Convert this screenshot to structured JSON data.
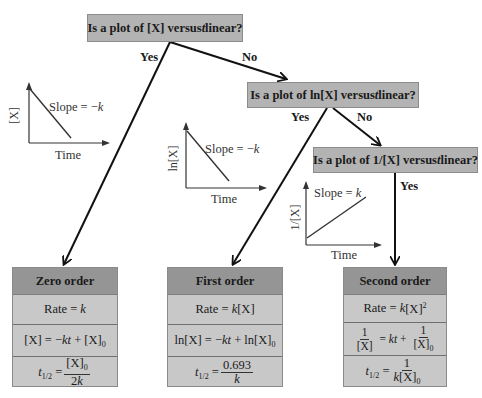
{
  "questions": [
    {
      "id": "q1",
      "pre": "Is a plot of [X] versus ",
      "var": "t",
      "post": " linear?"
    },
    {
      "id": "q2",
      "pre": "Is a plot of  ln[X] versus ",
      "var": "t",
      "post": " linear?"
    },
    {
      "id": "q3",
      "pre": "Is a plot of 1/[X] versus ",
      "var": "t",
      "post": " linear?"
    }
  ],
  "branches": {
    "q1_yes": "Yes",
    "q1_no": "No",
    "q2_yes": "Yes",
    "q2_no": "No",
    "q3_yes": "Yes"
  },
  "plots": [
    {
      "ylabel": "[X]",
      "xlabel": "Time",
      "slope_pre": "Slope = −",
      "slope_var": "k",
      "trend": "decreasing"
    },
    {
      "ylabel": "ln[X]",
      "xlabel": "Time",
      "slope_pre": "Slope = −",
      "slope_var": "k",
      "trend": "decreasing"
    },
    {
      "ylabel": "1/[X]",
      "xlabel": "Time",
      "slope_pre": "Slope = ",
      "slope_var": "k",
      "trend": "increasing"
    }
  ],
  "results": [
    {
      "title": "Zero order",
      "rate": {
        "pre": "Rate = ",
        "k": "k",
        "post": ""
      },
      "integrated": {
        "text": "[X] = −kt + [X]₀"
      },
      "half_life": {
        "lhs": "t1/2 = ",
        "num": "[X]₀",
        "den": "2k"
      }
    },
    {
      "title": "First order",
      "rate": {
        "pre": "Rate = ",
        "k": "k",
        "post": "[X]"
      },
      "integrated": {
        "text": "ln[X] = −kt + ln[X]₀"
      },
      "half_life": {
        "lhs": "t1/2 = ",
        "num": "0.693",
        "den": "k"
      }
    },
    {
      "title": "Second order",
      "rate": {
        "pre": "Rate = ",
        "k": "k",
        "post": "[X]²"
      },
      "integrated": {
        "text": "1/[X] = kt + 1/[X]₀"
      },
      "half_life": {
        "lhs": "t1/2 = ",
        "num": "1",
        "den": "k[X]₀"
      }
    }
  ],
  "colors": {
    "question_box": "#b3b3b3",
    "result_header": "#959595",
    "result_body": "#c8c8c8",
    "arrow": "#111111"
  }
}
